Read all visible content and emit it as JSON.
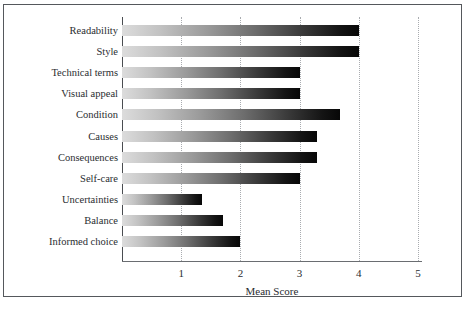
{
  "chart_data": {
    "type": "bar",
    "orientation": "horizontal",
    "title": "",
    "xlabel": "Mean Score",
    "ylabel": "",
    "xlim": [
      0,
      5
    ],
    "ylim": null,
    "grid": "vertical dotted gridlines at each integer tick",
    "legend": "none",
    "xticks": [
      1,
      2,
      3,
      4,
      5
    ],
    "xtick_labels": [
      "1",
      "2",
      "3",
      "4",
      "5"
    ],
    "categories": [
      "Readability",
      "Style",
      "Technical terms",
      "Visual appeal",
      "Condition",
      "Causes",
      "Consequences",
      "Self-care",
      "Uncertainties",
      "Balance",
      "Informed choice"
    ],
    "values": [
      4.0,
      4.0,
      3.0,
      3.0,
      3.68,
      3.3,
      3.3,
      3.0,
      1.35,
      1.7,
      2.0
    ],
    "series": [
      {
        "name": "Mean Score",
        "values": [
          4.0,
          4.0,
          3.0,
          3.0,
          3.68,
          3.3,
          3.3,
          3.0,
          1.35,
          1.7,
          2.0
        ]
      }
    ],
    "bar_style": {
      "fill": "horizontal gradient light-grey to black",
      "gradient_start_color": "#dcdcdc",
      "gradient_end_color": "#070707"
    }
  },
  "style": {
    "frame_border_color": "#55585c",
    "axis_color": "#4a4d51",
    "gridline_color": "#a9acb0",
    "text_color": "#2a2d30",
    "background": "#ffffff"
  }
}
